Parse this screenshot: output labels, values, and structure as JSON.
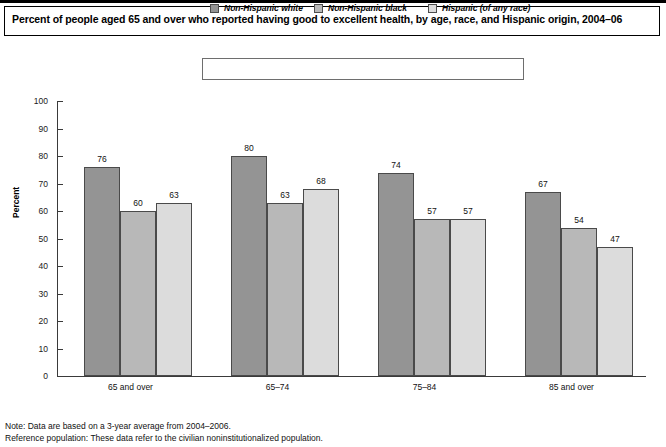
{
  "chart_title": "Percent of people aged 65 and over who reported having good to excellent health, by age, race, and Hispanic origin, 2004–06",
  "legend": {
    "items": [
      {
        "label": "Non-Hispanic white",
        "color": "#949494",
        "swatch_name": "legend-swatch-non-hispanic-white"
      },
      {
        "label": "Non-Hispanic black",
        "color": "#b8b8b8",
        "swatch_name": "legend-swatch-non-hispanic-black"
      },
      {
        "label": "Hispanic (of any race)",
        "color": "#dcdcdc",
        "swatch_name": "legend-swatch-hispanic"
      }
    ]
  },
  "footnotes": {
    "note": "Note: Data are based on a 3-year average from 2004–2006.",
    "reference": "Reference population: These data refer to the civilian noninstitutionalized population."
  },
  "chart_data": {
    "type": "bar",
    "title": "Percent of people aged 65 and over who reported having good to excellent health, by age, race, and Hispanic origin, 2004–06",
    "xlabel": "",
    "ylabel": "Percent",
    "ylim": [
      0,
      100
    ],
    "yticks": [
      0,
      10,
      20,
      30,
      40,
      50,
      60,
      70,
      80,
      90,
      100
    ],
    "grid": false,
    "legend_position": "top-center",
    "categories": [
      "65 and over",
      "65–74",
      "75–84",
      "85 and over"
    ],
    "series": [
      {
        "name": "Non-Hispanic white",
        "color": "#949494",
        "values": [
          76,
          80,
          74,
          67
        ]
      },
      {
        "name": "Non-Hispanic black",
        "color": "#b8b8b8",
        "values": [
          60,
          63,
          57,
          54
        ]
      },
      {
        "name": "Hispanic (of any race)",
        "color": "#dcdcdc",
        "values": [
          63,
          68,
          57,
          47
        ]
      }
    ]
  }
}
